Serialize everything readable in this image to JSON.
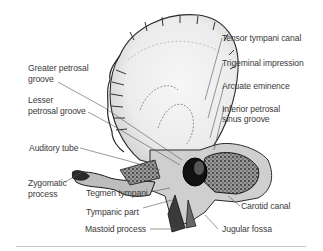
{
  "figure": {
    "labels": {
      "tensor_tympani_canal": "Tensor tympani canal",
      "trigeminal_impression": "Trigeminal impression",
      "arcuate_eminence": "Arcuate eminence",
      "inferior_petrosal_1": "Inferior petrosal",
      "inferior_petrosal_2": "sinus groove",
      "greater_petrosal_1": "Greater petrosal",
      "greater_petrosal_2": "groove",
      "lesser_petrosal_1": "Lesser",
      "lesser_petrosal_2": "petrosal groove",
      "auditory_tube": "Auditory tube",
      "zygomatic_1": "Zygomatic",
      "zygomatic_2": "process",
      "tegmen_tympani": "Tegmen tympani",
      "tympanic_part": "Tympanic part",
      "mastoid_process": "Mastoid process",
      "carotid_canal": "Carotid canal",
      "jugular_fossa": "Jugular fossa"
    },
    "colors": {
      "text": "#3a3a3a",
      "line": "#555555",
      "bone_light": "#f2f2f2",
      "bone_mid": "#d6d6d6",
      "bone_dark": "#1a1a1a",
      "divider": "#c8c8c8"
    }
  }
}
